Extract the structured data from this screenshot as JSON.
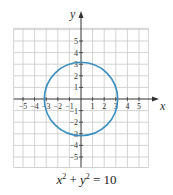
{
  "chart_data": {
    "type": "line",
    "title": "",
    "caption": "x² + y² = 10",
    "caption_parts": {
      "x": "x",
      "exp": "2",
      "plus": " + ",
      "y": "y",
      "eq": " = 10"
    },
    "xlabel": "x",
    "ylabel": "y",
    "xlim": [
      -5.8,
      5.8
    ],
    "ylim": [
      -5.9,
      6.1
    ],
    "x_ticks": [
      -5,
      -4,
      -3,
      -2,
      -1,
      1,
      2,
      3,
      4,
      5
    ],
    "y_ticks": [
      -5,
      -4,
      -3,
      -2,
      -1,
      1,
      2,
      3,
      4,
      5
    ],
    "grid": true,
    "series": [
      {
        "name": "circle",
        "equation": "x^2 + y^2 = 10",
        "center": [
          0,
          0
        ],
        "radius": 3.1623,
        "color": "#3a8fc0"
      }
    ]
  },
  "style": {
    "grid_color": "#c9c9c9",
    "axis_color": "#333333",
    "curve_color": "#3a8fc0",
    "origin_px": [
      81,
      99
    ],
    "unit_px": 11.6
  }
}
